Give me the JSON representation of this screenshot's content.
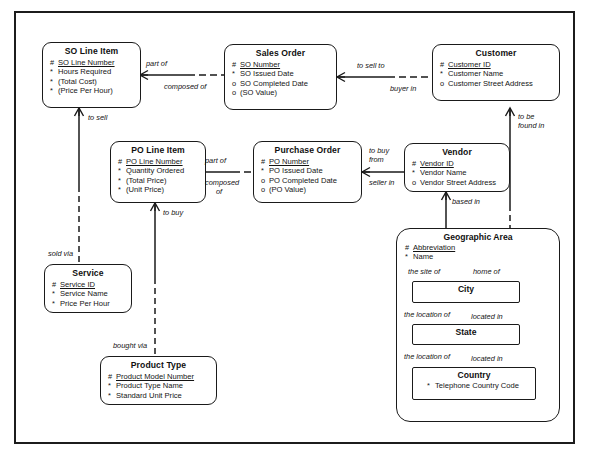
{
  "diagram": {
    "notation": "Barker ERD",
    "background_color": "#ffffff",
    "line_color": "#1a1a1a"
  },
  "entities": [
    {
      "id": "so_line_item",
      "name": "SO Line Item",
      "attributes": [
        {
          "mark": "#",
          "text": "SO Line Number",
          "key": true
        },
        {
          "mark": "*",
          "text": "Hours Required",
          "key": false
        },
        {
          "mark": "*",
          "text": "(Total Cost)",
          "key": false
        },
        {
          "mark": "*",
          "text": "(Price Per Hour)",
          "key": false
        }
      ]
    },
    {
      "id": "sales_order",
      "name": "Sales Order",
      "attributes": [
        {
          "mark": "#",
          "text": "SO Number",
          "key": true
        },
        {
          "mark": "*",
          "text": "SO Issued Date",
          "key": false
        },
        {
          "mark": "o",
          "text": "SO Completed Date",
          "key": false
        },
        {
          "mark": "o",
          "text": "(SO Value)",
          "key": false
        }
      ]
    },
    {
      "id": "customer",
      "name": "Customer",
      "attributes": [
        {
          "mark": "#",
          "text": "Customer ID",
          "key": true
        },
        {
          "mark": "*",
          "text": "Customer Name",
          "key": false
        },
        {
          "mark": "o",
          "text": "Customer Street Address",
          "key": false
        }
      ]
    },
    {
      "id": "po_line_item",
      "name": "PO Line Item",
      "attributes": [
        {
          "mark": "#",
          "text": "PO Line Number",
          "key": true
        },
        {
          "mark": "*",
          "text": "Quantity Ordered",
          "key": false
        },
        {
          "mark": "*",
          "text": "(Total Price)",
          "key": false
        },
        {
          "mark": "*",
          "text": "(Unit Price)",
          "key": false
        }
      ]
    },
    {
      "id": "purchase_order",
      "name": "Purchase Order",
      "attributes": [
        {
          "mark": "#",
          "text": "PO Number",
          "key": true
        },
        {
          "mark": "*",
          "text": "PO Issued Date",
          "key": false
        },
        {
          "mark": "o",
          "text": "PO Completed Date",
          "key": false
        },
        {
          "mark": "o",
          "text": "(PO Value)",
          "key": false
        }
      ]
    },
    {
      "id": "vendor",
      "name": "Vendor",
      "attributes": [
        {
          "mark": "#",
          "text": "Vendor ID",
          "key": true
        },
        {
          "mark": "*",
          "text": "Vendor Name",
          "key": false
        },
        {
          "mark": "o",
          "text": "Vendor Street Address",
          "key": false
        }
      ]
    },
    {
      "id": "service",
      "name": "Service",
      "attributes": [
        {
          "mark": "#",
          "text": "Service ID",
          "key": true
        },
        {
          "mark": "*",
          "text": "Service Name",
          "key": false
        },
        {
          "mark": "*",
          "text": "Price Per Hour",
          "key": false
        }
      ]
    },
    {
      "id": "product_type",
      "name": "Product Type",
      "attributes": [
        {
          "mark": "#",
          "text": "Product Model Number",
          "key": true
        },
        {
          "mark": "*",
          "text": "Product Type Name",
          "key": false
        },
        {
          "mark": "*",
          "text": "Standard Unit Price",
          "key": false
        }
      ]
    },
    {
      "id": "geographic_area",
      "name": "Geographic Area",
      "attributes": [
        {
          "mark": "#",
          "text": "Abbreviation",
          "key": true
        },
        {
          "mark": "*",
          "text": "Name",
          "key": false
        }
      ]
    },
    {
      "id": "city",
      "name": "City",
      "attributes": []
    },
    {
      "id": "state",
      "name": "State",
      "attributes": []
    },
    {
      "id": "country",
      "name": "Country",
      "attributes": [
        {
          "mark": "*",
          "text": "Telephone Country Code",
          "key": false
        }
      ]
    }
  ],
  "relationships": [
    {
      "id": "r1",
      "from": "so_line_item",
      "to": "sales_order",
      "label_from": "part of",
      "label_to": "composed of"
    },
    {
      "id": "r2",
      "from": "sales_order",
      "to": "customer",
      "label_from": "to sell to",
      "label_to": "buyer in"
    },
    {
      "id": "r3",
      "from": "po_line_item",
      "to": "purchase_order",
      "label_from": "part of",
      "label_to": "composed of"
    },
    {
      "id": "r4",
      "from": "purchase_order",
      "to": "vendor",
      "label_from": "to buy from",
      "label_to": "seller in"
    },
    {
      "id": "r5",
      "from": "so_line_item",
      "to": "service",
      "label_from": "to sell",
      "label_to": "sold via"
    },
    {
      "id": "r6",
      "from": "po_line_item",
      "to": "product_type",
      "label_from": "to buy",
      "label_to": "bought via"
    },
    {
      "id": "r7",
      "from": "customer",
      "to": "geographic_area",
      "label_from": "to be found in",
      "label_to": "home of"
    },
    {
      "id": "r8",
      "from": "vendor",
      "to": "geographic_area",
      "label_from": "based in",
      "label_to": "the site of"
    },
    {
      "id": "r9",
      "from": "city",
      "to": "state",
      "label_from": "located in",
      "label_to": "the location of"
    },
    {
      "id": "r10",
      "from": "state",
      "to": "country",
      "label_from": "located in",
      "label_to": "the location of"
    }
  ],
  "labels": {
    "part_of_1": "part of",
    "composed_of_1": "composed of",
    "to_sell_to": "to sell to",
    "buyer_in": "buyer in",
    "part_of_2": "part of",
    "composed_of_2a": "composed",
    "composed_of_2b": "of",
    "to_buy_from_a": "to buy",
    "to_buy_from_b": "from",
    "seller_in": "seller in",
    "to_sell": "to sell",
    "sold_via": "sold via",
    "to_buy": "to buy",
    "bought_via": "bought via",
    "to_be_found_in_a": "to be",
    "to_be_found_in_b": "found in",
    "home_of": "home of",
    "based_in": "based in",
    "the_site_of": "the site of",
    "located_in_1": "located in",
    "the_location_of_1": "the location of",
    "located_in_2": "located in",
    "the_location_of_2": "the location of"
  }
}
